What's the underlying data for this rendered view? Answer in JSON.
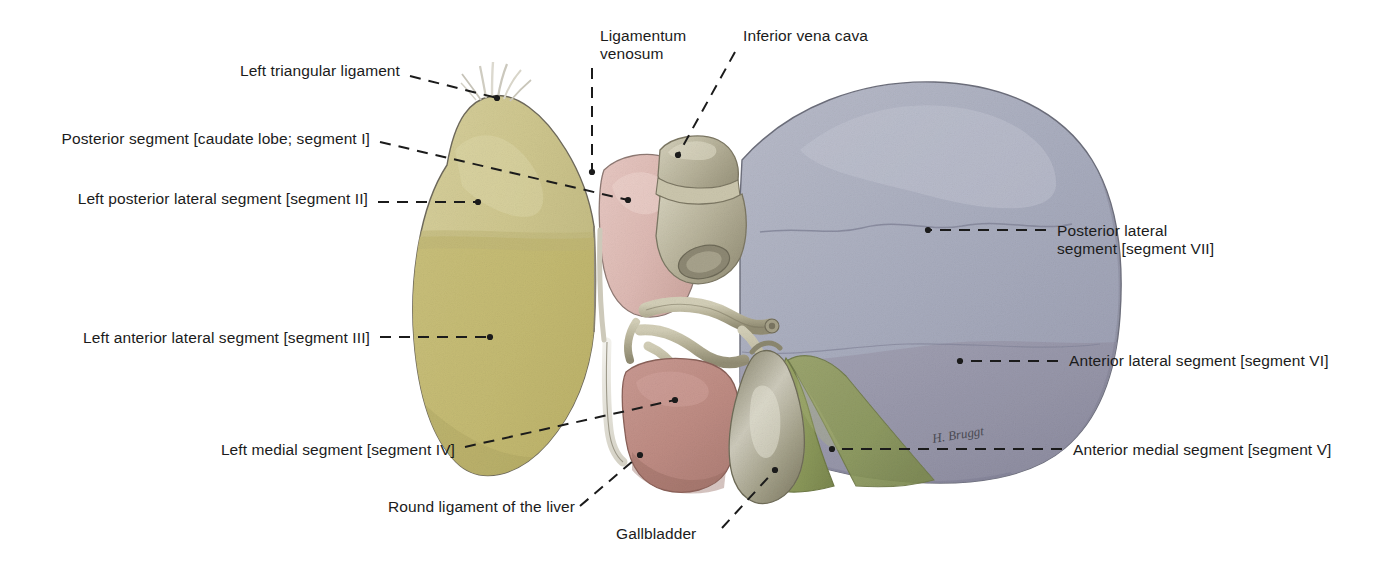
{
  "figure": {
    "signature": "H. Bruggt",
    "palette": {
      "left_lobe_upper": "#cfc78f",
      "left_lobe_lower": "#c3b970",
      "right_lobe_upper": "#a9adbe",
      "right_lobe_lower": "#9b9aac",
      "caudate_pink": "#e0bdb8",
      "quadrate_pink": "#c08d84",
      "segment_v_green": "#8d9a5c",
      "vessel_tan": "#bdb89a",
      "gallbladder": "#9d9a83",
      "ligament_white": "#e8e6df",
      "outline": "#6f6a5c",
      "leader": "#1b1b1b",
      "text": "#1b1b1b",
      "background": "#ffffff"
    }
  },
  "labels": [
    {
      "id": "left-triangular-ligament",
      "text": "Left triangular ligament",
      "side": "left",
      "x": 400,
      "y": 62,
      "leader": [
        [
          410,
          76
        ],
        [
          497,
          98
        ]
      ],
      "arrow": true
    },
    {
      "id": "posterior-segment-caudate-lobe-segment-i",
      "text": "Posterior segment [caudate lobe; segment I]",
      "side": "left",
      "x": 370,
      "y": 130,
      "leader": [
        [
          380,
          142
        ],
        [
          628,
          200
        ]
      ],
      "arrow": true
    },
    {
      "id": "left-posterior-lateral-segment-segment-ii",
      "text": "Left posterior lateral segment [segment II]",
      "side": "left",
      "x": 368,
      "y": 190,
      "leader": [
        [
          378,
          202
        ],
        [
          478,
          202
        ]
      ],
      "arrow": true
    },
    {
      "id": "left-anterior-lateral-segment-segment-iii",
      "text": "Left anterior lateral segment [segment III]",
      "side": "left",
      "x": 370,
      "y": 329,
      "leader": [
        [
          380,
          337
        ],
        [
          490,
          337
        ]
      ],
      "arrow": true
    },
    {
      "id": "left-medial-segment-segment-iv",
      "text": "Left medial segment [segment IV]",
      "side": "left",
      "x": 455,
      "y": 441,
      "leader": [
        [
          465,
          447
        ],
        [
          675,
          400
        ]
      ],
      "arrow": true
    },
    {
      "id": "ligamentum-venosum",
      "text": "Ligamentum\nvenosum",
      "side": "top",
      "x": 600,
      "y": 27,
      "leader": [
        [
          592,
          68
        ],
        [
          592,
          172
        ]
      ],
      "arrow": true
    },
    {
      "id": "inferior-vena-cava",
      "text": "Inferior vena cava",
      "side": "top",
      "x": 743,
      "y": 27,
      "leader": [
        [
          735,
          52
        ],
        [
          678,
          155
        ]
      ],
      "arrow": true
    },
    {
      "id": "posterior-lateral-segment-segment-vii",
      "text": "Posterior lateral\nsegment [segment VII]",
      "side": "right",
      "x": 1057,
      "y": 222,
      "leader": [
        [
          1046,
          230
        ],
        [
          928,
          230
        ]
      ],
      "arrow": true
    },
    {
      "id": "anterior-lateral-segment-segment-vi",
      "text": "Anterior lateral segment [segment VI]",
      "side": "right",
      "x": 1069,
      "y": 352,
      "leader": [
        [
          1058,
          361
        ],
        [
          960,
          361
        ]
      ],
      "arrow": true
    },
    {
      "id": "anterior-medial-segment-segment-v",
      "text": "Anterior medial segment [segment V]",
      "side": "right",
      "x": 1073,
      "y": 441,
      "leader": [
        [
          1062,
          449
        ],
        [
          832,
          449
        ]
      ],
      "arrow": true
    },
    {
      "id": "round-ligament-of-the-liver",
      "text": "Round ligament of the liver",
      "side": "bottom",
      "x": 388,
      "y": 498,
      "leader": [
        [
          580,
          506
        ],
        [
          640,
          455
        ]
      ],
      "arrow": true
    },
    {
      "id": "gallbladder",
      "text": "Gallbladder",
      "side": "bottom",
      "x": 616,
      "y": 525,
      "leader": [
        [
          722,
          528
        ],
        [
          775,
          470
        ]
      ],
      "arrow": true
    }
  ]
}
